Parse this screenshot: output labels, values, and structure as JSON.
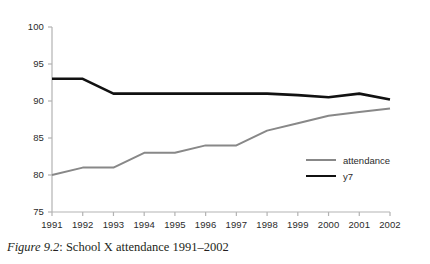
{
  "caption": {
    "figure_label": "Figure 9.2",
    "separator": ": ",
    "text": "School X attendance 1991–2002"
  },
  "legend": {
    "position": "inside-right",
    "items": [
      {
        "label": "attendance",
        "color": "#888888"
      },
      {
        "label": "y7",
        "color": "#111111"
      }
    ]
  },
  "axes": {
    "y_ticks": [
      "100",
      "95",
      "90",
      "85",
      "80",
      "75"
    ],
    "x_ticks": [
      "1991",
      "1992",
      "1993",
      "1994",
      "1995",
      "1996",
      "1997",
      "1998",
      "1999",
      "2000",
      "2001",
      "2002"
    ]
  },
  "chart_data": {
    "type": "line",
    "title": "School X attendance 1991–2002",
    "xlabel": "",
    "ylabel": "",
    "x": [
      1991,
      1992,
      1993,
      1994,
      1995,
      1996,
      1997,
      1998,
      1999,
      2000,
      2001,
      2002
    ],
    "categories": [
      "1991",
      "1992",
      "1993",
      "1994",
      "1995",
      "1996",
      "1997",
      "1998",
      "1999",
      "2000",
      "2001",
      "2002"
    ],
    "series": [
      {
        "name": "attendance",
        "color": "#888888",
        "line_width": 2,
        "values": [
          80,
          81,
          81,
          83,
          83,
          84,
          84,
          86,
          87,
          88,
          88.5,
          89
        ]
      },
      {
        "name": "y7",
        "color": "#111111",
        "line_width": 2.6,
        "values": [
          93,
          93,
          91,
          91,
          91,
          91,
          91,
          91,
          90.8,
          90.5,
          91,
          90.2
        ]
      }
    ],
    "ylim": [
      75,
      100
    ],
    "ytick_values": [
      75,
      80,
      85,
      90,
      95,
      100
    ],
    "xlim": [
      1991,
      2002
    ],
    "grid": false,
    "legend_position": "inside-right",
    "axis_color": "#b3b3b3"
  }
}
